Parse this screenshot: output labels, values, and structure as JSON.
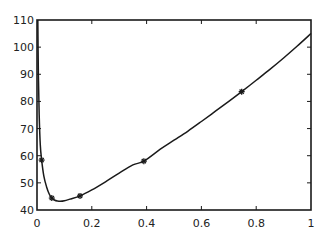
{
  "chart_data": {
    "type": "line",
    "title": "",
    "xlabel": "",
    "ylabel": "",
    "xlim": [
      0,
      1
    ],
    "ylim": [
      40,
      110
    ],
    "grid": false,
    "legend": null,
    "x_ticks": [
      0,
      0.2,
      0.4,
      0.6,
      0.8,
      1
    ],
    "x_tick_labels": [
      "0",
      "0.2",
      "0.4",
      "0.6",
      "0.8",
      "1"
    ],
    "y_ticks": [
      40,
      50,
      60,
      70,
      80,
      90,
      100,
      110
    ],
    "y_tick_labels": [
      "40",
      "50",
      "60",
      "70",
      "80",
      "90",
      "100",
      "110"
    ],
    "series": [
      {
        "name": "curve",
        "style": "solid",
        "color": "#1a1a1a",
        "x": [
          0.003,
          0.005,
          0.008,
          0.012,
          0.017,
          0.025,
          0.035,
          0.045,
          0.054,
          0.065,
          0.075,
          0.085,
          0.1,
          0.12,
          0.157,
          0.2,
          0.25,
          0.3,
          0.35,
          0.39,
          0.45,
          0.5,
          0.55,
          0.6,
          0.65,
          0.7,
          0.747,
          0.8,
          0.85,
          0.9,
          0.95,
          1.0
        ],
        "y": [
          110,
          90,
          75,
          64,
          58.4,
          52.5,
          48.5,
          45.8,
          44.4,
          43.6,
          43.3,
          43.2,
          43.4,
          44.0,
          45.2,
          47.4,
          50.4,
          53.6,
          56.6,
          58.0,
          62.4,
          65.7,
          69.0,
          72.6,
          76.3,
          80.0,
          83.6,
          87.8,
          91.8,
          96.0,
          100.4,
          105.0
        ]
      },
      {
        "name": "markers",
        "style": "markers",
        "marker": "asterisk",
        "color": "#1a1a1a",
        "x": [
          0.017,
          0.054,
          0.157,
          0.39,
          0.747
        ],
        "y": [
          58.4,
          44.4,
          45.2,
          58.0,
          83.6
        ]
      }
    ]
  }
}
